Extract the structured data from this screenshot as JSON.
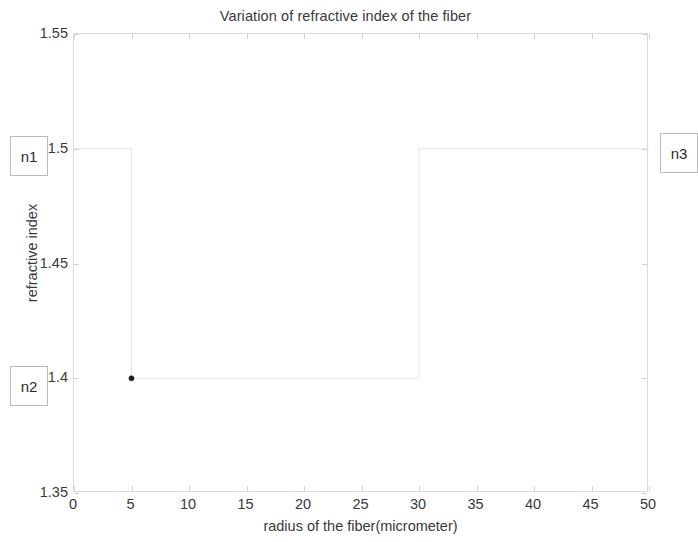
{
  "chart_data": {
    "type": "line",
    "title": "Variation of refractive index of the fiber",
    "xlabel": "radius of the fiber(micrometer)",
    "ylabel": "refractive index",
    "xlim": [
      0,
      50
    ],
    "ylim": [
      1.35,
      1.55
    ],
    "xticks": [
      0,
      5,
      10,
      15,
      20,
      25,
      30,
      35,
      40,
      45,
      50
    ],
    "xtick_labels": [
      "0",
      "5",
      "10",
      "15",
      "20",
      "25",
      "30",
      "35",
      "40",
      "45",
      "50"
    ],
    "yticks": [
      1.35,
      1.4,
      1.45,
      1.5,
      1.55
    ],
    "ytick_labels": [
      "1.35",
      "1.4",
      "1.45",
      "1.5",
      "1.55"
    ],
    "grid": false,
    "legend": null,
    "line_color": "#e3e6e8",
    "marker_color": "#1d1d1d",
    "series": [
      {
        "name": "refractive index profile",
        "x": [
          0,
          5,
          5,
          30,
          30,
          50
        ],
        "y": [
          1.5,
          1.5,
          1.4,
          1.4,
          1.5,
          1.5
        ],
        "step": "post"
      }
    ],
    "markers": [
      {
        "x": 5,
        "y": 1.4
      }
    ],
    "annotations": [
      {
        "name": "n1",
        "label": "n1",
        "x": 0.0,
        "y": 1.5,
        "boxed": true
      },
      {
        "name": "n2",
        "label": "n2",
        "x": 0.0,
        "y": 1.4,
        "boxed": true
      },
      {
        "name": "n3",
        "label": "n3",
        "x": 50.0,
        "y": 1.5,
        "boxed": true
      }
    ]
  },
  "figure": {
    "title": "Variation of refractive index of the fiber",
    "xlabel": "radius of the fiber(micrometer)",
    "ylabel": "refractive index"
  },
  "annotations": {
    "n1": "n1",
    "n2": "n2",
    "n3": "n3"
  }
}
